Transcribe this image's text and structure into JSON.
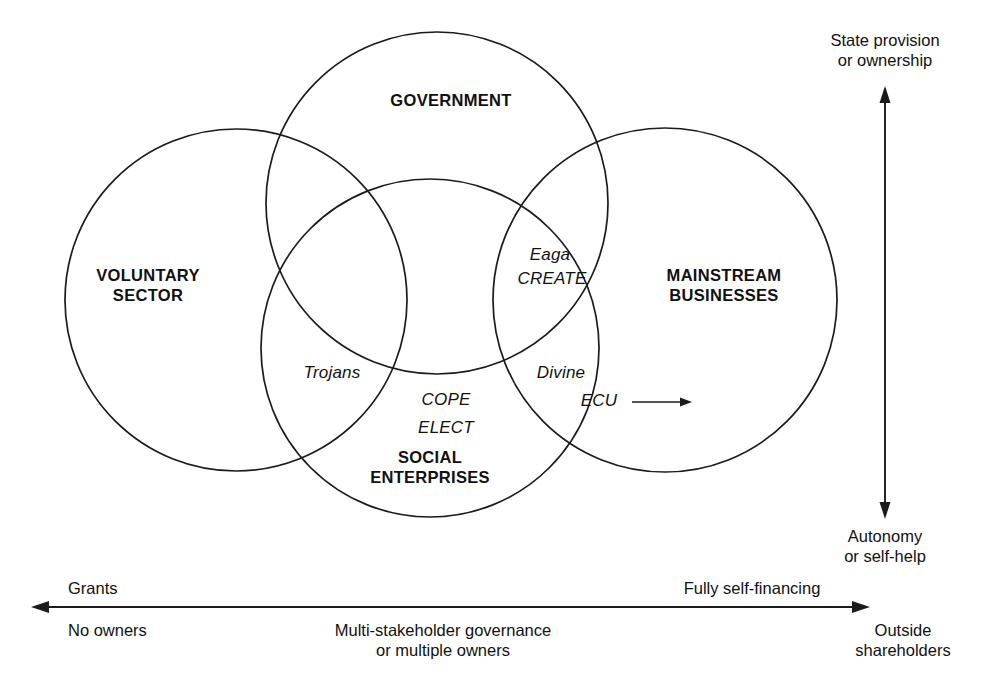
{
  "diagram": {
    "background_color": "#ffffff",
    "stroke_color": "#1b1b1b",
    "sets": [
      {
        "id": "voluntary",
        "label_line1": "VOLUNTARY",
        "label_line2": "SECTOR",
        "cx": 236,
        "cy": 300,
        "r": 171
      },
      {
        "id": "government",
        "label_line1": "GOVERNMENT",
        "label_line2": "",
        "cx": 437,
        "cy": 203,
        "r": 171
      },
      {
        "id": "mainstream",
        "label_line1": "MAINSTREAM",
        "label_line2": "BUSINESSES",
        "cx": 665,
        "cy": 300,
        "r": 172
      },
      {
        "id": "social",
        "label_line1": "SOCIAL",
        "label_line2": "ENTERPRISES",
        "cx": 430,
        "cy": 348,
        "r": 169
      }
    ],
    "organisations": [
      {
        "id": "eaga",
        "label": "Eaga",
        "region": "government-mainstream-social"
      },
      {
        "id": "create",
        "label": "CREATE",
        "region": "government-mainstream-social"
      },
      {
        "id": "trojans",
        "label": "Trojans",
        "region": "voluntary-government"
      },
      {
        "id": "cope",
        "label": "COPE",
        "region": "social-core"
      },
      {
        "id": "elect",
        "label": "ELECT",
        "region": "social-core"
      },
      {
        "id": "divine",
        "label": "Divine",
        "region": "mainstream-social"
      },
      {
        "id": "ecu",
        "label": "ECU",
        "region": "mainstream-social"
      }
    ],
    "vertical_axis": {
      "top_line1": "State provision",
      "top_line2": "or ownership",
      "bottom_line1": "Autonomy",
      "bottom_line2": "or self-help"
    },
    "horizontal_axis": {
      "left_above": "Grants",
      "left_below": "No owners",
      "middle_line1": "Multi-stakeholder governance",
      "middle_line2": "or multiple owners",
      "right_above": "Fully self-financing",
      "right_below_line1": "Outside",
      "right_below_line2": "shareholders"
    }
  }
}
